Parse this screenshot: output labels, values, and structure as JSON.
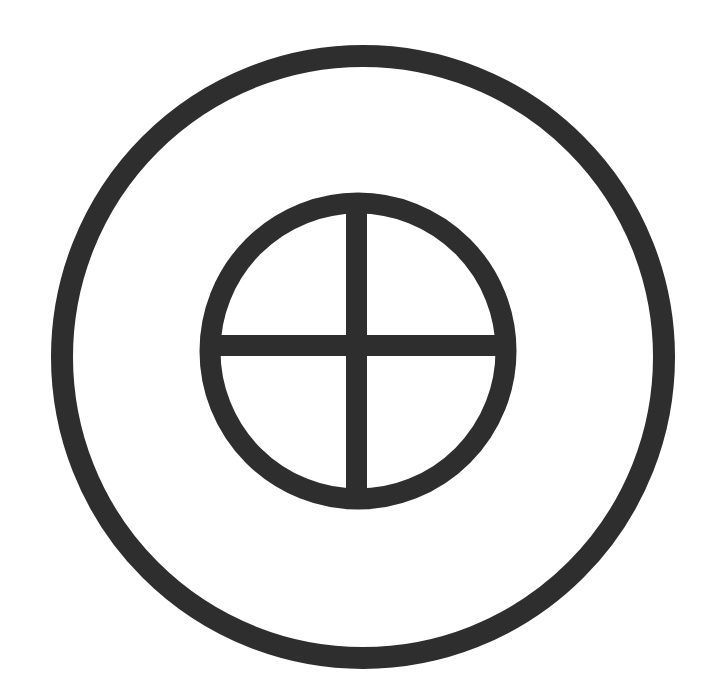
{
  "symbol": {
    "name": "sun cross within circle",
    "ink_color": "#2e2e2e",
    "background_color": "#ffffff",
    "outer_ring": {
      "cx": 363,
      "cy": 357,
      "r": 301,
      "stroke_width": 22
    },
    "inner_ring": {
      "cx": 358,
      "cy": 351,
      "r": 148,
      "stroke_width": 21
    },
    "cross": {
      "vertical": {
        "x": 346,
        "y": 203,
        "width": 21,
        "height": 297
      },
      "horizontal": {
        "x": 210,
        "y": 335,
        "width": 297,
        "height": 21
      }
    }
  }
}
